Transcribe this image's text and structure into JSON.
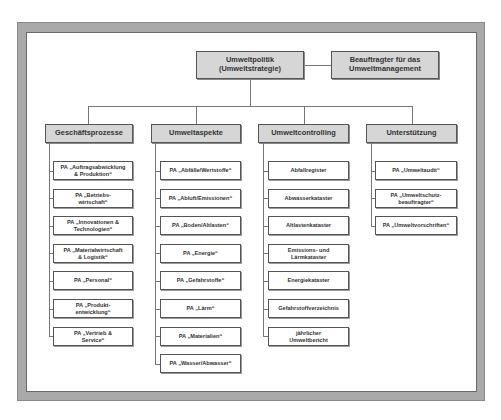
{
  "diagram": {
    "root": {
      "line1": "Umweltpolitik",
      "line2": "(Umweltstrategie)"
    },
    "side": {
      "line1": "Beauftragter für das",
      "line2": "Umweltmanagement"
    },
    "categories": [
      {
        "label": "Geschäftsprozesse",
        "children": [
          {
            "line1": "PA „Auftragsabwicklung",
            "line2": "& Produktion“"
          },
          {
            "line1": "PA „Betriebs-",
            "line2": "wirtschaft“"
          },
          {
            "line1": "PA „Innovationen &",
            "line2": "Technologien“"
          },
          {
            "line1": "PA „Materialwirtschaft",
            "line2": "& Logistik“"
          },
          {
            "line1": "PA „Personal“",
            "line2": ""
          },
          {
            "line1": "PA „Produkt-",
            "line2": "entwicklung“"
          },
          {
            "line1": "PA „Vertrieb &",
            "line2": "Service“"
          }
        ]
      },
      {
        "label": "Umweltaspekte",
        "children": [
          {
            "line1": "PA „Abfälle/Wertstoffe“",
            "line2": ""
          },
          {
            "line1": "PA „Abluft/Emissionen“",
            "line2": ""
          },
          {
            "line1": "PA „Boden/Altlasten“",
            "line2": ""
          },
          {
            "line1": "PA „Energie“",
            "line2": ""
          },
          {
            "line1": "PA „Gefahrstoffe“",
            "line2": ""
          },
          {
            "line1": "PA „Lärm“",
            "line2": ""
          },
          {
            "line1": "PA „Materialien“",
            "line2": ""
          },
          {
            "line1": "PA „Wasser/Abwasser“",
            "line2": ""
          }
        ]
      },
      {
        "label": "Umweltcontrolling",
        "children": [
          {
            "line1": "Abfallregister",
            "line2": ""
          },
          {
            "line1": "Abwasserkataster",
            "line2": ""
          },
          {
            "line1": "Altlastenkataster",
            "line2": ""
          },
          {
            "line1": "Emissions- und",
            "line2": "Lärmkataster"
          },
          {
            "line1": "Energiekataster",
            "line2": ""
          },
          {
            "line1": "Gefahrstoffverzeichnis",
            "line2": ""
          },
          {
            "line1": "jährlicher",
            "line2": "Umweltbericht"
          }
        ]
      },
      {
        "label": "Unterstützung",
        "children": [
          {
            "line1": "PA „Umweltaudit“",
            "line2": ""
          },
          {
            "line1": "PA „Umweltschutz-",
            "line2": "beauftragter“"
          },
          {
            "line1": "PA „Umweltvorschriften“",
            "line2": ""
          }
        ]
      }
    ]
  }
}
